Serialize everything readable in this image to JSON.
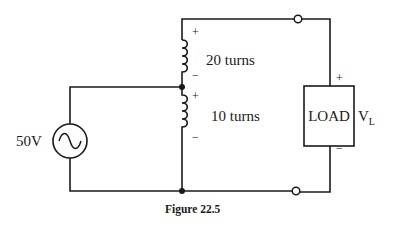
{
  "figure": {
    "caption": "Figure 22.5",
    "source": {
      "label": "50V",
      "type": "ac-voltage-source"
    },
    "upper_winding": {
      "label": "20 turns",
      "plus": "+",
      "minus": "−"
    },
    "lower_winding": {
      "label": "10 turns",
      "plus": "+",
      "minus": "−"
    },
    "load": {
      "label": "LOAD",
      "plus": "+",
      "minus": "−"
    },
    "output_voltage": {
      "symbol": "V",
      "subscript": "L"
    }
  }
}
